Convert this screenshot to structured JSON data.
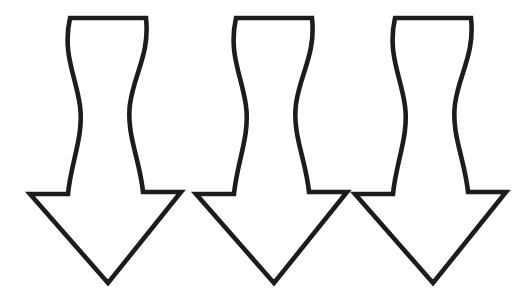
{
  "canvas": {
    "width": 528,
    "height": 298,
    "background_color": "#ffffff",
    "description": "Three identical outlined downward-pointing wavy arrows arranged in a horizontal row"
  },
  "graphic": {
    "name": "wavy-down-arrow-row",
    "shape_type": "arrow",
    "direction": "down",
    "count": 3,
    "style": "outline",
    "stroke_color": "#1c1c1c",
    "fill_color": "#ffffff",
    "stroke_width": 4.6
  },
  "arrows": [
    {
      "id": "arrow-1",
      "label": "Wavy down arrow 1",
      "offset_x": 0,
      "offset_y": 0
    },
    {
      "id": "arrow-2",
      "label": "Wavy down arrow 2",
      "offset_x": 166,
      "offset_y": 0
    },
    {
      "id": "arrow-3",
      "label": "Wavy down arrow 3",
      "offset_x": 325,
      "offset_y": 0
    }
  ],
  "geometry": {
    "top_edge_left_x": 70,
    "top_edge_right_x": 146,
    "top_edge_y": 18,
    "barb_left_x": 30,
    "barb_right_x": 181,
    "barb_y": 194,
    "shaft_left_bottom_x": 68,
    "shaft_right_bottom_x": 143,
    "tip_x": 108,
    "tip_y": 283,
    "path": "M70,18 L146,18 C150,54 134,74 130,104 C126,134 140,160 143,192 L181,192 L108,283 L30,194 L68,194 C71,162 84,136 80,106 C76,76 62,54 70,18 Z"
  }
}
